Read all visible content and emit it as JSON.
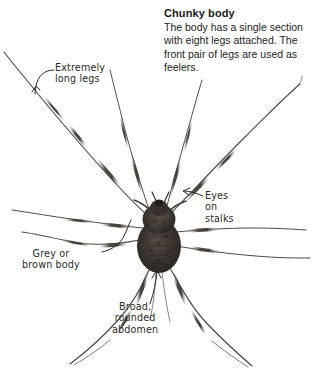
{
  "page": {
    "background_color": "#ffffff",
    "width": 320,
    "height": 384
  },
  "caption": {
    "title": "Chunky body",
    "body": "The body has a single section with eight legs attached. The front pair of legs are used as feelers."
  },
  "annotations": [
    {
      "id": "extremely-long-legs",
      "text": "Extremely\nlong legs",
      "leader": "curve-down-left-arrow"
    },
    {
      "id": "eyes-on-stalks",
      "text": "Eyes\non\nstalks",
      "leader": "curve-left-arrow"
    },
    {
      "id": "grey-or-brown-body",
      "text": "Grey or\nbrown body",
      "leader": "curve-up-right"
    },
    {
      "id": "broad-rounded-abdomen",
      "text": "Broad,\nrounded\nabdomen",
      "leader": "curve-up-arrow"
    }
  ],
  "colors": {
    "ink": "#2a2a2a",
    "caption_title": "#1b1b1b",
    "caption_body": "#232323",
    "body_dark": "#3a3631",
    "body_mid": "#6d6761",
    "leg_dark": "#4a4641",
    "leg_light": "#8e8a85"
  }
}
